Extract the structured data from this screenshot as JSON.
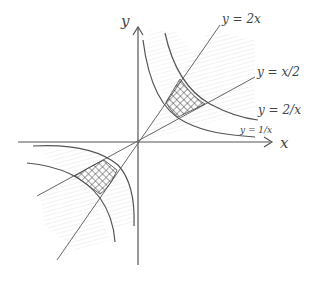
{
  "diagram": {
    "type": "hand-drawn coordinate sketch",
    "axes": {
      "x_label": "x",
      "y_label": "y"
    },
    "curves": [
      {
        "id": "line-2x",
        "label": "y = 2x",
        "kind": "line"
      },
      {
        "id": "line-half-x",
        "label": "y = x/2",
        "kind": "line"
      },
      {
        "id": "hyperbola-2-over-x",
        "label": "y = 2/x",
        "kind": "hyperbola"
      },
      {
        "id": "hyperbola-1-over-x",
        "label": "y = 1/x",
        "kind": "hyperbola"
      }
    ],
    "regions": [
      {
        "id": "region-q1",
        "description": "cross-hatched region in first quadrant bounded by y=x/2, y=2x, y=1/x, y=2/x"
      },
      {
        "id": "region-q3",
        "description": "cross-hatched region in third quadrant bounded by y=x/2, y=2x, y=1/x, y=2/x"
      }
    ],
    "colors": {
      "ink": "#555555",
      "shade": "#d8d8d8",
      "hatch": "#333333"
    }
  }
}
